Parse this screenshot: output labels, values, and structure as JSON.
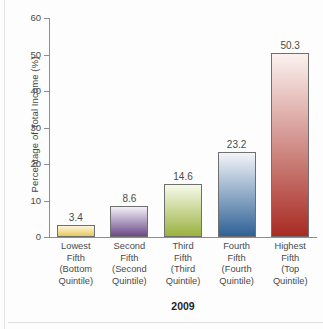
{
  "chart_data": {
    "type": "bar",
    "title": "",
    "subtitle": "",
    "xlabel": "2009",
    "ylabel": "Percentage of Total Income (%)",
    "ylim": [
      0,
      60
    ],
    "yticks": [
      0,
      10,
      20,
      30,
      40,
      50,
      60
    ],
    "grid": false,
    "legend": "none",
    "categories": [
      "Lowest\nFifth\n(Bottom\nQuintile)",
      "Second\nFifth\n(Second\nQuintile)",
      "Third\nFifth\n(Third\nQuintile)",
      "Fourth\nFifth\n(Fourth\nQuintile)",
      "Highest\nFifth\n(Top\nQuintile)"
    ],
    "category_lines": [
      [
        "Lowest",
        "Fifth",
        "(Bottom",
        "Quintile)"
      ],
      [
        "Second",
        "Fifth",
        "(Second",
        "Quintile)"
      ],
      [
        "Third",
        "Fifth",
        "(Third",
        "Quintile)"
      ],
      [
        "Fourth",
        "Fifth",
        "(Fourth",
        "Quintile)"
      ],
      [
        "Highest",
        "Fifth",
        "(Top",
        "Quintile)"
      ]
    ],
    "values": [
      3.4,
      8.6,
      14.6,
      23.2,
      50.3
    ],
    "value_labels": [
      "3.4",
      "8.6",
      "14.6",
      "23.2",
      "50.3"
    ],
    "bar_colors": [
      "#e8c85c",
      "#6b4a87",
      "#9bb23f",
      "#2f6196",
      "#a82b23"
    ],
    "bar_top_colors": [
      "#fdf6dd",
      "#f3f0f7",
      "#f7faeb",
      "#f2f5f8",
      "#fbf2ef"
    ]
  },
  "axis": {
    "y_title": "Percentage of Total Income (%)",
    "x_title": "2009",
    "tick_labels": [
      "60",
      "50",
      "40",
      "30",
      "20",
      "10",
      "0"
    ]
  }
}
